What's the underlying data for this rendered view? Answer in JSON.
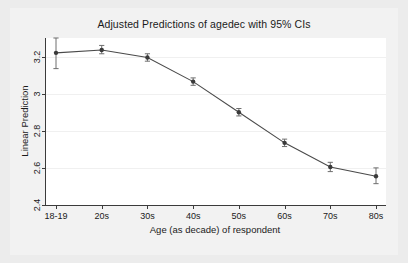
{
  "chart": {
    "title": "Adjusted Predictions of agedec with 95% CIs",
    "xlabel": "Age (as decade) of respondent",
    "ylabel": "Linear Prediction"
  },
  "chart_data": {
    "type": "line",
    "title": "Adjusted Predictions of agedec with 95% CIs",
    "xlabel": "Age (as decade) of respondent",
    "ylabel": "Linear Prediction",
    "categories": [
      "18-19",
      "20s",
      "30s",
      "40s",
      "50s",
      "60s",
      "70s",
      "80s"
    ],
    "values": [
      3.22,
      3.235,
      3.195,
      3.065,
      2.9,
      2.735,
      2.605,
      2.555
    ],
    "ci_low": [
      3.135,
      3.215,
      3.175,
      3.045,
      2.88,
      2.715,
      2.58,
      2.515
    ],
    "ci_high": [
      3.3,
      3.26,
      3.215,
      3.085,
      2.92,
      2.755,
      2.63,
      2.6
    ],
    "ci_level": "95%",
    "ylim": [
      2.4,
      3.3
    ],
    "yticks": [
      2.4,
      2.6,
      2.8,
      3.0,
      3.2
    ],
    "ytick_labels": [
      "2.4",
      "2.6",
      "2.8",
      "3",
      "3.2"
    ],
    "grid": true,
    "grid_axis": "y",
    "legend": null,
    "marker": "circle",
    "line_color": "#4a4a4a",
    "marker_color": "#3a3a3a",
    "error_bar_color": "#6e6e6e",
    "plot_bgcolor": "#ffffff",
    "figure_bgcolor": "#ececec"
  },
  "colors": {
    "line": "#4a4a4a",
    "marker": "#3a3a3a",
    "errorbar": "#6e6e6e",
    "grid": "#f0f0f0",
    "axis": "#3b3b3b",
    "text": "#1a1a1a",
    "plot_bg": "#ffffff",
    "figure_bg": "#ececec",
    "graph_region_bg": "#f2f2f2"
  }
}
